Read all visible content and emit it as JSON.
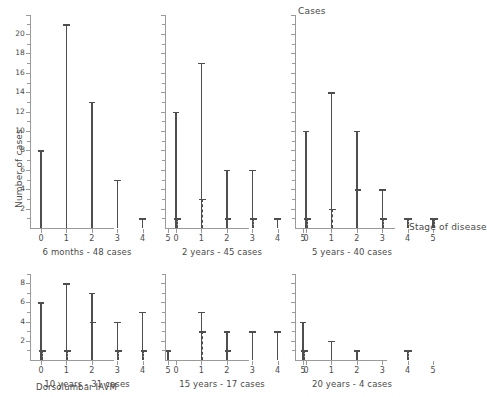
{
  "figure": {
    "y_axis_title": "Number of cases",
    "cases_label": "Cases",
    "x_axis_title": "Stage of disease",
    "figure_caption": "Dorsolumbar IAVM"
  },
  "chart_data": {
    "type": "bar",
    "title": "Dorsolumbar IAVM",
    "xlabel": "Stage of disease",
    "ylabel": "Number of cases",
    "categories": [
      "0",
      "1",
      "2",
      "3",
      "4",
      "5"
    ],
    "grid": false,
    "legend": "none",
    "panels": [
      {
        "id": "panel-6-months",
        "caption": "6 months - 48 cases",
        "ylim": [
          0,
          22
        ],
        "yticks": [
          2,
          4,
          6,
          8,
          10,
          12,
          14,
          16,
          18,
          20
        ],
        "ytick_labels": [
          "2",
          "4",
          "6",
          "8",
          "10",
          "12",
          "14",
          "16",
          "18",
          "20"
        ],
        "series": [
          {
            "name": "solid",
            "style": "solid",
            "values": [
              8,
              21,
              13,
              5,
              1,
              0
            ]
          },
          {
            "name": "dashed",
            "style": "dashed",
            "values": [
              0,
              0,
              0,
              0,
              0,
              0
            ]
          }
        ]
      },
      {
        "id": "panel-2-years",
        "caption": "2 years - 45 cases",
        "ylim": [
          0,
          22
        ],
        "yticks": [
          2,
          4,
          6,
          8,
          10,
          12,
          14,
          16,
          18,
          20
        ],
        "ytick_labels": [
          "",
          "",
          "",
          "",
          "",
          "",
          "",
          "",
          "",
          ""
        ],
        "series": [
          {
            "name": "solid",
            "style": "solid",
            "values": [
              12,
              17,
              6,
              6,
              1,
              0
            ]
          },
          {
            "name": "dashed",
            "style": "dashed",
            "values": [
              1,
              3,
              1,
              1,
              0,
              0
            ]
          }
        ]
      },
      {
        "id": "panel-5-years",
        "caption": "5 years - 40 cases",
        "ylim": [
          0,
          22
        ],
        "yticks": [
          2,
          4,
          6,
          8,
          10,
          12,
          14,
          16,
          18,
          20
        ],
        "ytick_labels": [
          "",
          "",
          "",
          "",
          "",
          "",
          "",
          "",
          "",
          ""
        ],
        "series": [
          {
            "name": "solid",
            "style": "solid",
            "values": [
              10,
              14,
              10,
              4,
              1,
              1
            ]
          },
          {
            "name": "dashed",
            "style": "dashed",
            "values": [
              1,
              2,
              4,
              1,
              1,
              1
            ]
          }
        ]
      },
      {
        "id": "panel-10-years",
        "caption": "10 years - 31 cases",
        "ylim": [
          0,
          9
        ],
        "yticks": [
          2,
          4,
          6,
          8
        ],
        "ytick_labels": [
          "2",
          "4",
          "6",
          "8"
        ],
        "series": [
          {
            "name": "solid",
            "style": "solid",
            "values": [
              6,
              8,
              7,
              4,
              5,
              1
            ]
          },
          {
            "name": "dashed",
            "style": "dashed",
            "values": [
              1,
              1,
              4,
              1,
              1,
              0
            ]
          }
        ]
      },
      {
        "id": "panel-15-years",
        "caption": "15 years - 17 cases",
        "ylim": [
          0,
          9
        ],
        "yticks": [
          2,
          4,
          6,
          8
        ],
        "ytick_labels": [
          "",
          "",
          "",
          ""
        ],
        "series": [
          {
            "name": "solid",
            "style": "solid",
            "values": [
              0,
              5,
              3,
              3,
              3,
              4
            ]
          },
          {
            "name": "dashed",
            "style": "dashed",
            "values": [
              0,
              3,
              1,
              0,
              0,
              1
            ]
          }
        ]
      },
      {
        "id": "panel-20-years",
        "caption": "20 years - 4 cases",
        "ylim": [
          0,
          9
        ],
        "yticks": [
          2,
          4,
          6,
          8
        ],
        "ytick_labels": [
          "",
          "",
          "",
          ""
        ],
        "series": [
          {
            "name": "solid",
            "style": "solid",
            "values": [
              0,
              2,
              1,
              0,
              1,
              0
            ]
          },
          {
            "name": "dashed",
            "style": "dashed",
            "values": [
              0,
              0,
              0,
              0,
              1,
              0
            ]
          }
        ]
      }
    ]
  }
}
